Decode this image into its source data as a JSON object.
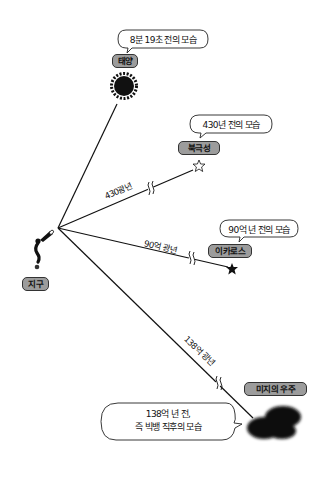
{
  "observer": {
    "label": "지구",
    "icon": "person-with-telescope-icon"
  },
  "objects": [
    {
      "id": "sun",
      "label": "태양",
      "bubble": "8분 19초 전의 모습",
      "distance": "",
      "icon": "sun-icon"
    },
    {
      "id": "polaris",
      "label": "북극성",
      "bubble": "430년 전의 모습",
      "distance": "430광년",
      "icon": "outline-star-icon"
    },
    {
      "id": "icarus",
      "label": "이카로스",
      "bubble": "90억 년 전의 모습",
      "distance": "90억 광년",
      "icon": "filled-star-icon"
    },
    {
      "id": "unknown-universe",
      "label": "미지의 우주",
      "bubble_line1": "138억 년 전,",
      "bubble_line2": "즉 빅뱅 직후의 모습",
      "distance": "138억 광년",
      "icon": "dark-blob-icon"
    }
  ],
  "colors": {
    "background": "#ffffff",
    "line": "#111111",
    "tag_fill": "#9c9c9c",
    "tag_border": "#333333",
    "bubble_border": "#222222"
  }
}
